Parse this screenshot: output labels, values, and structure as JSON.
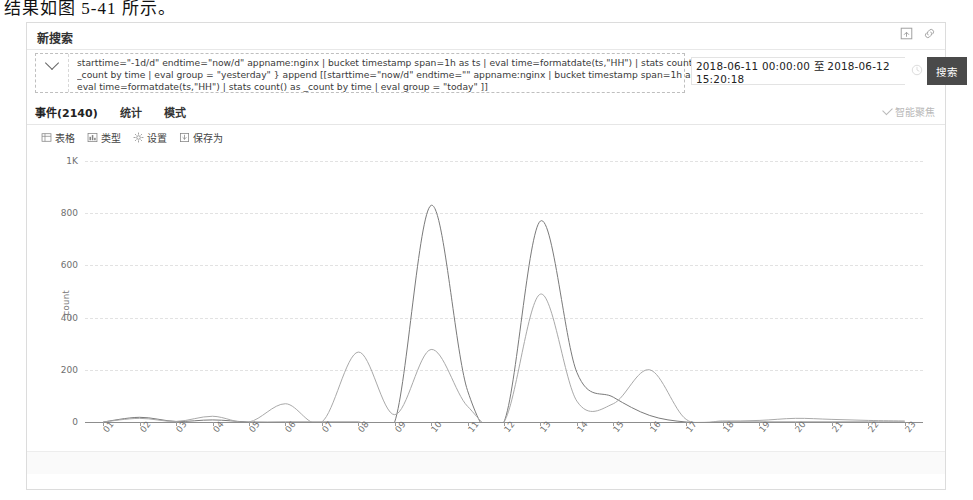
{
  "document_caption": "结果如图 5-41 所示。",
  "panel": {
    "title": "新搜索",
    "icons": [
      {
        "name": "save-search-icon",
        "label": "save-search"
      },
      {
        "name": "share-link-icon",
        "label": "share-link"
      }
    ]
  },
  "search": {
    "expand_icon": "chevron-down-icon",
    "query_lines": [
      "starttime=\"-1d/d\" endtime=\"now/d\"   appname:nginx | bucket timestamp span=1h as ts | eval time=formatdate(ts,\"HH\") | stats count() as",
      "_count by time | eval group = \"yesterday\" }  append [[starttime=\"now/d\" endtime=\"\"   appname:nginx | bucket timestamp span=1h as ts |",
      "eval time=formatdate(ts,\"HH\") | stats count() as _count by time | eval group = \"today\" ]]"
    ],
    "time_range": "2018-06-11 00:00:00 至 2018-06-12 15:20:18",
    "clock_icon": "clock-icon",
    "search_button": "搜索"
  },
  "tabs": [
    {
      "label": "事件(2140)",
      "active": true
    },
    {
      "label": "统计",
      "active": false
    },
    {
      "label": "模式",
      "active": false
    }
  ],
  "focus_toggle": {
    "label": "智能聚焦",
    "checked": true
  },
  "chart_toolbar": [
    {
      "icon": "table-icon",
      "label": "表格"
    },
    {
      "icon": "chart-type-icon",
      "label": "类型"
    },
    {
      "icon": "gear-icon",
      "label": "设置"
    },
    {
      "icon": "save-as-icon",
      "label": "保存为"
    }
  ],
  "chart_data": {
    "type": "line",
    "title": "",
    "xlabel": "",
    "ylabel": "_count",
    "ylim": [
      0,
      1000
    ],
    "yticks": [
      0,
      200,
      400,
      600,
      800,
      1000
    ],
    "ytick_labels": [
      "0",
      "200",
      "400",
      "600",
      "800",
      "1K"
    ],
    "grid": true,
    "legend_position": "bottom",
    "x": [
      "01",
      "02",
      "03",
      "04",
      "05",
      "06",
      "07",
      "08",
      "09",
      "10",
      "11",
      "12",
      "13",
      "14",
      "15",
      "16",
      "17",
      "18",
      "19",
      "20",
      "21",
      "22",
      "23"
    ],
    "series": [
      {
        "name": "today",
        "color": "#7a7a7a",
        "values": [
          0,
          18,
          2,
          8,
          0,
          0,
          0,
          0,
          0,
          830,
          120,
          0,
          770,
          190,
          95,
          25,
          0,
          0,
          0,
          0,
          0,
          0,
          0
        ]
      },
      {
        "name": "yesterday",
        "color": "#a9a9a9",
        "values": [
          0,
          14,
          2,
          22,
          0,
          70,
          0,
          268,
          28,
          278,
          60,
          0,
          490,
          80,
          70,
          200,
          10,
          4,
          6,
          14,
          10,
          6,
          4
        ]
      }
    ]
  }
}
